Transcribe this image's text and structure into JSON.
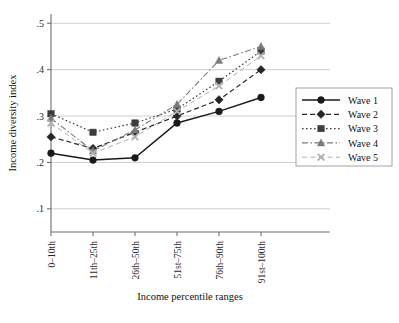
{
  "chart_data": {
    "type": "line",
    "title": "",
    "xlabel": "Income percentile ranges",
    "ylabel": "Income diversity index",
    "categories": [
      "0–10th",
      "11th–25th",
      "26th–50th",
      "51st–75th",
      "76th–90th",
      "91st–100th"
    ],
    "ylim": [
      0.05,
      0.52
    ],
    "yticks": [
      0.1,
      0.2,
      0.3,
      0.4,
      0.5
    ],
    "ytick_labels": [
      ".1",
      ".2",
      ".3",
      ".4",
      ".5"
    ],
    "grid": "horizontal",
    "legend_position": "bottom-right",
    "series": [
      {
        "name": "Wave 1",
        "marker": "circle",
        "dash": "solid",
        "color": "#1a1a1a",
        "values": [
          0.22,
          0.205,
          0.21,
          0.285,
          0.31,
          0.34
        ]
      },
      {
        "name": "Wave 2",
        "marker": "diamond",
        "dash": "dashed",
        "color": "#262626",
        "values": [
          0.255,
          0.23,
          0.265,
          0.3,
          0.335,
          0.4
        ]
      },
      {
        "name": "Wave 3",
        "marker": "square",
        "dash": "dotted",
        "color": "#3d3d3d",
        "values": [
          0.305,
          0.265,
          0.285,
          0.315,
          0.375,
          0.44
        ]
      },
      {
        "name": "Wave 4",
        "marker": "triangle",
        "dash": "dashdot",
        "color": "#7a7a7a",
        "values": [
          0.295,
          0.225,
          0.27,
          0.325,
          0.42,
          0.45
        ]
      },
      {
        "name": "Wave 5",
        "marker": "x",
        "dash": "dashed-light",
        "color": "#b0b0b0",
        "values": [
          0.285,
          0.22,
          0.255,
          0.31,
          0.365,
          0.43
        ]
      }
    ]
  }
}
